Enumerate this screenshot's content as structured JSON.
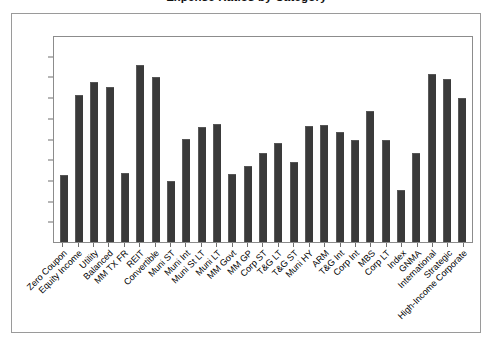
{
  "figure": {
    "clipped_title": "Expense Ratios by Category"
  },
  "chart_data": {
    "type": "bar",
    "title": "",
    "xlabel": "",
    "ylabel": "",
    "ylim": [
      0.0,
      2.0
    ],
    "ytick_step": 0.2,
    "grid": false,
    "legend": "none",
    "bar_color": "#3a3a3a",
    "ytick_labels": [
      "2.00",
      "1.80",
      "1.60",
      "1.40",
      "1.20",
      "1.00",
      "0.80",
      "0.60",
      "0.40",
      "0.20",
      "0.00"
    ],
    "ytick_values": [
      2.0,
      1.8,
      1.6,
      1.4,
      1.2,
      1.0,
      0.8,
      0.6,
      0.4,
      0.2,
      0.0
    ],
    "categories": [
      "Zero Coupon",
      "Equity Income",
      "Utility",
      "Balanced",
      "MM TX FR",
      "REIT",
      "Convertible",
      "Muni ST",
      "Muni Int",
      "Muni St LT",
      "Muni LT",
      "MM Govt",
      "MM GP",
      "Corp ST",
      "T&G LT",
      "T&G ST",
      "Muni HY",
      "ARM",
      "T&G Int",
      "Corp Int",
      "MBS",
      "Corp LT",
      "Index",
      "GNMA",
      "International",
      "Strategic",
      "High-Income Corporate"
    ],
    "values": [
      0.64,
      1.42,
      1.55,
      1.5,
      0.66,
      1.72,
      1.6,
      0.59,
      1.0,
      1.11,
      1.14,
      0.65,
      0.73,
      0.86,
      0.96,
      0.77,
      1.12,
      1.13,
      1.06,
      0.99,
      1.27,
      0.99,
      0.5,
      0.86,
      1.63,
      1.58,
      1.4
    ]
  }
}
